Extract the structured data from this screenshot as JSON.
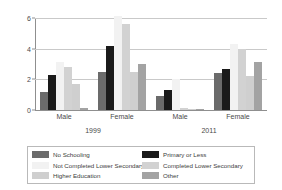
{
  "chart_data": {
    "type": "bar",
    "title": "",
    "subtitle": "",
    "xlabel": "",
    "ylabel": "",
    "ylim": [
      0,
      6
    ],
    "yticks": [
      0,
      2,
      4,
      6
    ],
    "ytick_labels": [
      "0",
      "2",
      "4",
      "6"
    ],
    "grid": true,
    "legend_position": "bottom",
    "categories": [
      "Male",
      "Female",
      "Male",
      "Female"
    ],
    "group_periods": [
      "1999",
      "2011"
    ],
    "period_labels": [
      {
        "label": "1999",
        "covers": [
          "Male",
          "Female"
        ]
      },
      {
        "label": "2011",
        "covers": [
          "Male",
          "Female"
        ]
      }
    ],
    "series": [
      {
        "name": "No Schooling",
        "color": "#6b6b6b",
        "values": [
          1.2,
          2.5,
          0.9,
          2.4
        ]
      },
      {
        "name": "Primary or Less",
        "color": "#1a1a1a",
        "values": [
          2.3,
          4.2,
          1.3,
          2.7
        ]
      },
      {
        "name": "Not Completed Lower Secondary",
        "color": "#f2f2f2",
        "values": [
          3.15,
          6.1,
          2.0,
          4.3
        ]
      },
      {
        "name": "Completed Lower Secondary",
        "color": "#d2d2d2",
        "values": [
          2.8,
          5.6,
          0.1,
          4.0
        ]
      },
      {
        "name": "Higher Education",
        "color": "#cfcfcf",
        "values": [
          1.7,
          2.5,
          0.05,
          2.2
        ]
      },
      {
        "name": "Other",
        "color": "#a3a3a3",
        "values": [
          0.12,
          3.0,
          0.05,
          3.1
        ]
      }
    ],
    "legend_columns": [
      [
        "No Schooling",
        "Not Completed Lower Secondary",
        "Higher Education"
      ],
      [
        "Primary or Less",
        "Completed Lower Secondary",
        "Other"
      ]
    ]
  },
  "colors": {
    "axis": "#8f8f8f",
    "grid": "#c9c9c9",
    "text": "#4a4a4a",
    "legend_border": "#b9b9b9",
    "background": "#ffffff"
  }
}
